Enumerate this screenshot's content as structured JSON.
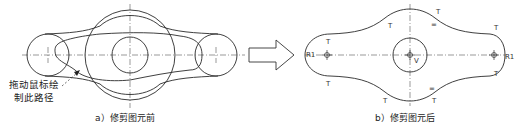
{
  "figure_a": {
    "caption": "a）修剪图元前",
    "annotation_line1": "拖动鼠标绘",
    "annotation_line2": "制此路径"
  },
  "figure_b": {
    "caption": "b）修剪图元后",
    "constraint_marks": {
      "tangent": "T",
      "radius_left": "R1",
      "radius_right": "R1",
      "vertical": "V",
      "equal": "="
    }
  },
  "arrow": {
    "direction": "right"
  },
  "colors": {
    "line": "#2a2a2a",
    "background": "#ffffff"
  }
}
